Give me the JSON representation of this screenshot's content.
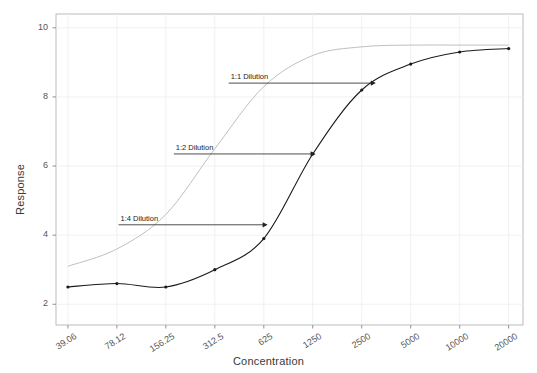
{
  "chart_data": {
    "type": "line",
    "title": "",
    "xlabel": "Concentration",
    "ylabel": "Response",
    "x_scale": "log",
    "xticks": [
      "39.06",
      "78.12",
      "156.25",
      "312.5",
      "625",
      "1250",
      "2500",
      "5000",
      "10000",
      "20000"
    ],
    "xtick_values": [
      39.06,
      78.12,
      156.25,
      312.5,
      625,
      1250,
      2500,
      5000,
      10000,
      20000
    ],
    "yticks": [
      "2",
      "4",
      "6",
      "8",
      "10"
    ],
    "ytick_values": [
      2,
      4,
      6,
      8,
      10
    ],
    "ylim": [
      1.4,
      10.4
    ],
    "grid": true,
    "legend": "none",
    "series": [
      {
        "name": "sample-curve",
        "color": "#1a1a1a",
        "points_x": [
          39.06,
          78.12,
          156.25,
          312.5,
          625,
          1250,
          2500,
          5000,
          10000,
          20000
        ],
        "points_y": [
          2.5,
          2.6,
          2.5,
          3.0,
          3.9,
          6.35,
          8.2,
          8.95,
          9.3,
          9.4
        ]
      },
      {
        "name": "reference-curve",
        "color": "#b8b8b8",
        "points_x": [
          39.06,
          78.12,
          156.25,
          312.5,
          625,
          1250,
          2500,
          5000,
          10000,
          20000
        ],
        "points_y": [
          3.1,
          3.6,
          4.6,
          6.5,
          8.3,
          9.2,
          9.45,
          9.5,
          9.5,
          9.5
        ]
      }
    ],
    "annotations": [
      {
        "label": "1:1 Dilution",
        "y": 8.4,
        "x_start": 380,
        "x_end": 3050
      },
      {
        "label": "1:2 Dilution",
        "y": 6.35,
        "x_start": 175,
        "x_end": 1300
      },
      {
        "label": "1:4 Dilution",
        "y": 4.3,
        "x_start": 80,
        "x_end": 660
      }
    ]
  }
}
